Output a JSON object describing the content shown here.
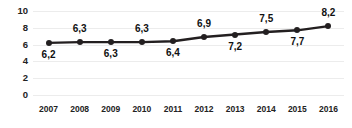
{
  "chart_data": {
    "type": "line",
    "title": "",
    "xlabel": "",
    "ylabel": "",
    "categories": [
      "2007",
      "2008",
      "2009",
      "2010",
      "2011",
      "2012",
      "2013",
      "2014",
      "2015",
      "2016"
    ],
    "values": [
      6.2,
      6.3,
      6.3,
      6.3,
      6.4,
      6.9,
      7.2,
      7.5,
      7.7,
      8.2
    ],
    "point_labels": [
      "6,2",
      "6,3",
      "6,3",
      "6,3",
      "6,4",
      "6,9",
      "7,2",
      "7,5",
      "7,7",
      "8,2"
    ],
    "label_positions": [
      "below",
      "above",
      "below",
      "above",
      "below",
      "above",
      "below",
      "above",
      "below",
      "above"
    ],
    "ylim": [
      0,
      10
    ],
    "yticks": [
      0,
      2,
      4,
      6,
      8,
      10
    ],
    "ytick_labels": [
      "0",
      "2",
      "4",
      "6",
      "8",
      "10"
    ],
    "grid": true,
    "legend": "none",
    "series_color": "#231f20",
    "grid_color": "#ececec",
    "marker": "circle",
    "decimal_separator": ","
  }
}
